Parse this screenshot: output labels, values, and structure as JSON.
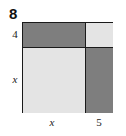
{
  "problem": {
    "number": "8"
  },
  "diagram": {
    "type": "area-model-square",
    "colors": {
      "dark_fill": "#7e7e7e",
      "light_fill": "#e4e4e4",
      "outline": "#1a1a1a",
      "background": "#ffffff"
    },
    "regions": [
      {
        "position": "top-left",
        "shade": "dark",
        "width_label": "x",
        "height_label": "4"
      },
      {
        "position": "top-right",
        "shade": "light",
        "width_label": "5",
        "height_label": "4"
      },
      {
        "position": "bottom-left",
        "shade": "light",
        "width_label": "x",
        "height_label": "x"
      },
      {
        "position": "bottom-right",
        "shade": "dark",
        "width_label": "5",
        "height_label": "x"
      }
    ],
    "labels": {
      "left_top": "4",
      "left_bottom": "x",
      "bottom_left": "x",
      "bottom_right": "5"
    }
  }
}
